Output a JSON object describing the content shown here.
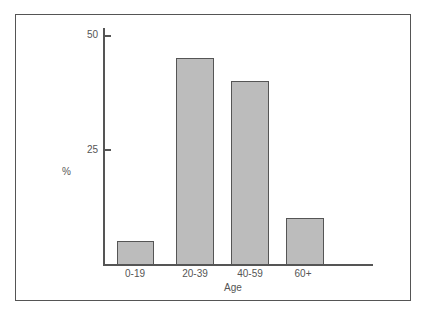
{
  "chart_data": {
    "type": "bar",
    "title": "",
    "categories": [
      "0-19",
      "20-39",
      "40-59",
      "60+"
    ],
    "values": [
      5,
      45,
      40,
      10
    ],
    "xlabel": "Age",
    "ylabel": "%",
    "ylim": [
      0,
      50
    ],
    "yticks": [
      "25",
      "50"
    ],
    "grid": false,
    "legend": null
  },
  "axis": {
    "y_label": "%",
    "x_label": "Age",
    "tick_25": "25",
    "tick_50": "50"
  },
  "bars": [
    {
      "label": "0-19",
      "value": 5
    },
    {
      "label": "20-39",
      "value": 45
    },
    {
      "label": "40-59",
      "value": 40
    },
    {
      "label": "60+",
      "value": 10
    }
  ]
}
